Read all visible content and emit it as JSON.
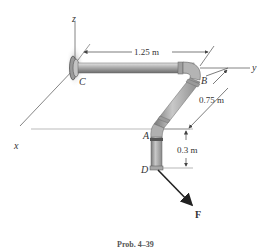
{
  "figure": {
    "caption": "Prob. 4–39",
    "axes": {
      "x": "x",
      "y": "y",
      "z": "z"
    },
    "points": {
      "C": "C",
      "B": "B",
      "A": "A",
      "D": "D"
    },
    "force_label": "F",
    "dimensions": {
      "CB": "1.25 m",
      "BA": "0.75 m",
      "AD": "0.3 m"
    },
    "colors": {
      "pipe": "#a8a8a8",
      "pipe_dark": "#7a7a7a",
      "wall_shade": "#b0b0b0",
      "line": "#555555",
      "force": "#222222"
    }
  }
}
